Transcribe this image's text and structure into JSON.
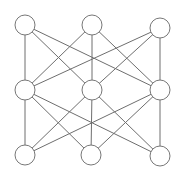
{
  "diagram": {
    "type": "layered-network-graph",
    "layers": 3,
    "nodes_per_layer": 3,
    "style": {
      "edge_color": "#6e6e6e",
      "node_stroke": "#777777",
      "node_fill": "#ffffff",
      "background": "#ffffff",
      "node_radius": 10
    },
    "nodes": [
      {
        "id": "top-left",
        "layer": 0,
        "x": 25,
        "y": 25
      },
      {
        "id": "top-middle",
        "layer": 0,
        "x": 92,
        "y": 25
      },
      {
        "id": "top-right",
        "layer": 0,
        "x": 160,
        "y": 28
      },
      {
        "id": "middle-left",
        "layer": 1,
        "x": 25,
        "y": 90
      },
      {
        "id": "middle-center",
        "layer": 1,
        "x": 92,
        "y": 90
      },
      {
        "id": "middle-right",
        "layer": 1,
        "x": 160,
        "y": 90
      },
      {
        "id": "bottom-left",
        "layer": 2,
        "x": 25,
        "y": 155
      },
      {
        "id": "bottom-middle",
        "layer": 2,
        "x": 91,
        "y": 155
      },
      {
        "id": "bottom-right",
        "layer": 2,
        "x": 160,
        "y": 156
      }
    ],
    "edges": [
      [
        "top-left",
        "middle-left"
      ],
      [
        "top-left",
        "middle-center"
      ],
      [
        "top-left",
        "middle-right"
      ],
      [
        "top-middle",
        "middle-left"
      ],
      [
        "top-middle",
        "middle-center"
      ],
      [
        "top-middle",
        "middle-right"
      ],
      [
        "top-right",
        "middle-left"
      ],
      [
        "top-right",
        "middle-center"
      ],
      [
        "top-right",
        "middle-right"
      ],
      [
        "middle-left",
        "bottom-left"
      ],
      [
        "middle-left",
        "bottom-middle"
      ],
      [
        "middle-left",
        "bottom-right"
      ],
      [
        "middle-center",
        "bottom-left"
      ],
      [
        "middle-center",
        "bottom-middle"
      ],
      [
        "middle-center",
        "bottom-right"
      ],
      [
        "middle-right",
        "bottom-left"
      ],
      [
        "middle-right",
        "bottom-middle"
      ],
      [
        "middle-right",
        "bottom-right"
      ]
    ]
  }
}
